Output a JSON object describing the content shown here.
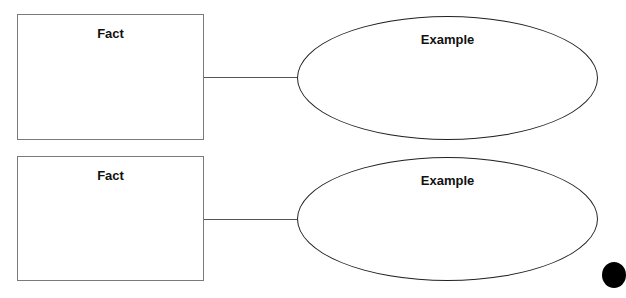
{
  "pairs": [
    {
      "fact_label": "Fact",
      "example_label": "Example"
    },
    {
      "fact_label": "Fact",
      "example_label": "Example"
    }
  ],
  "colors": {
    "box_border": "#7a7a7a",
    "ellipse_border": "#222222",
    "connector": "#555555"
  }
}
